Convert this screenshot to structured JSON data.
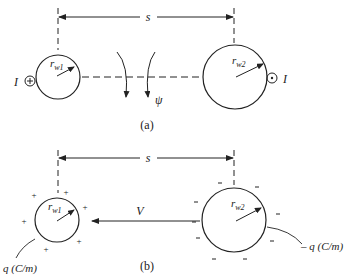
{
  "figure": {
    "panel_a": {
      "caption": "(a)",
      "spacing_label": "s",
      "conductor1": {
        "radius_label": "r",
        "radius_sub": "w1",
        "current_label": "I",
        "current_symbol": "⊕"
      },
      "conductor2": {
        "radius_label": "r",
        "radius_sub": "w2",
        "current_label": "I",
        "current_symbol": "⊙"
      },
      "flux_label": "ψ"
    },
    "panel_b": {
      "caption": "(b)",
      "spacing_label": "s",
      "voltage_label": "V",
      "conductor1": {
        "radius_label": "r",
        "radius_sub": "w1",
        "charge_label": "q (C/m)",
        "charge_sign": "+"
      },
      "conductor2": {
        "radius_label": "r",
        "radius_sub": "w2",
        "charge_label": "– q (C/m)",
        "charge_sign": "–"
      }
    },
    "colors": {
      "line": "#222222",
      "background": "#ffffff"
    }
  }
}
